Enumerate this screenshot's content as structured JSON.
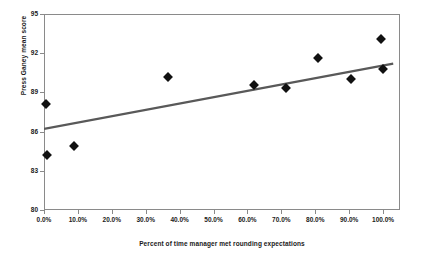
{
  "chart_data": {
    "type": "scatter",
    "title": "",
    "xlabel": "Percent of time manager met rounding expectations",
    "ylabel": "Press Ganey mean score",
    "xlim": [
      0,
      105
    ],
    "ylim": [
      80,
      95
    ],
    "grid": false,
    "legend": null,
    "xticks": [
      "0.0%",
      "10.0%",
      "20.0%",
      "30.0%",
      "40.0%",
      "50.0%",
      "60.0%",
      "70.0%",
      "80.0%",
      "90.0%",
      "100.0%"
    ],
    "xtick_values": [
      0,
      10,
      20,
      30,
      40,
      50,
      60,
      70,
      80,
      90,
      100
    ],
    "yticks": [
      "80",
      "83",
      "86",
      "89",
      "92",
      "95"
    ],
    "ytick_values": [
      80,
      83,
      86,
      89,
      92,
      95
    ],
    "marker": "diamond",
    "marker_color": "#111111",
    "points": [
      {
        "x": 0.5,
        "y": 88.1
      },
      {
        "x": 1.0,
        "y": 84.2
      },
      {
        "x": 8.8,
        "y": 84.9
      },
      {
        "x": 36.5,
        "y": 90.2
      },
      {
        "x": 62.0,
        "y": 89.6
      },
      {
        "x": 71.5,
        "y": 89.3
      },
      {
        "x": 80.8,
        "y": 91.6
      },
      {
        "x": 90.5,
        "y": 90.0
      },
      {
        "x": 99.5,
        "y": 93.1
      },
      {
        "x": 100.0,
        "y": 90.8
      }
    ],
    "trendline": {
      "color": "#595959",
      "x_start": 0,
      "y_start": 86.2,
      "x_end": 103,
      "y_end": 91.2
    }
  }
}
